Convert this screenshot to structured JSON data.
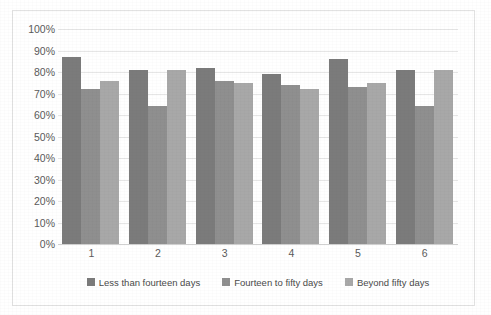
{
  "chart_data": {
    "type": "bar",
    "title": "",
    "xlabel": "",
    "ylabel": "",
    "categories": [
      "1",
      "2",
      "3",
      "4",
      "5",
      "6"
    ],
    "ylim": [
      0,
      100
    ],
    "ytick_labels": [
      "100%",
      "90%",
      "80%",
      "70%",
      "60%",
      "50%",
      "40%",
      "30%",
      "20%",
      "10%",
      "0%"
    ],
    "ytick_values": [
      100,
      90,
      80,
      70,
      60,
      50,
      40,
      30,
      20,
      10,
      0
    ],
    "grid": true,
    "grid_axis": "y",
    "legend_position": "bottom",
    "value_unit": "%",
    "series": [
      {
        "name": "Less than fourteen days",
        "color": "#7b7b7b",
        "values": [
          87,
          81,
          82,
          79,
          86,
          81
        ]
      },
      {
        "name": "Fourteen to fifty days",
        "color": "#8f8f8f",
        "values": [
          72,
          64,
          76,
          74,
          73,
          64
        ]
      },
      {
        "name": "Beyond fifty days",
        "color": "#a8a8a8",
        "values": [
          76,
          81,
          75,
          72,
          75,
          81
        ]
      }
    ]
  },
  "colors": {
    "series_1": "#7b7b7b",
    "series_2": "#8f8f8f",
    "series_3": "#a8a8a8",
    "gridline": "#e6e6e6",
    "border": "#e2e2e2",
    "text": "#5a5a5a",
    "background": "#ffffff"
  }
}
